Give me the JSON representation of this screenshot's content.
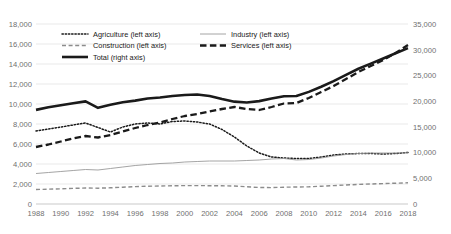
{
  "chart_data": {
    "type": "line",
    "title": "",
    "subtitle": "",
    "xlabel": "",
    "ylabel": "",
    "y2label": "",
    "ylim": [
      0,
      18000
    ],
    "y2lim": [
      0,
      35000
    ],
    "ytick_step": 2000,
    "y2tick_step": 5000,
    "grid": true,
    "legend_position": "top-left-inside",
    "x": [
      1988,
      1989,
      1990,
      1991,
      1992,
      1993,
      1994,
      1995,
      1996,
      1997,
      1998,
      1999,
      2000,
      2001,
      2002,
      2003,
      2004,
      2005,
      2006,
      2007,
      2008,
      2009,
      2010,
      2011,
      2012,
      2013,
      2014,
      2015,
      2016,
      2017,
      2018
    ],
    "xticks": [
      1988,
      1990,
      1992,
      1994,
      1996,
      1998,
      2000,
      2002,
      2004,
      2006,
      2008,
      2010,
      2012,
      2014,
      2016,
      2018
    ],
    "xtick_labels": [
      "1988",
      "1990",
      "1992",
      "1994",
      "1996",
      "1998",
      "2000",
      "2002",
      "2004",
      "2006",
      "2008",
      "2010",
      "2012",
      "2014",
      "2016",
      "2018"
    ],
    "ytick_labels": [
      "0",
      "2,000",
      "4,000",
      "6,000",
      "8,000",
      "10,000",
      "12,000",
      "14,000",
      "16,000",
      "18,000"
    ],
    "y2tick_labels": [
      "0",
      "5,000",
      "10,000",
      "15,000",
      "20,000",
      "25,000",
      "30,000",
      "35,000"
    ],
    "series": [
      {
        "name": "Agriculture (left axis)",
        "axis": "left",
        "style": "dotted",
        "color": "#1a1a1a",
        "width": 1.5,
        "values": [
          7300,
          7500,
          7700,
          7900,
          8100,
          7650,
          7200,
          7700,
          8000,
          8100,
          8000,
          8250,
          8300,
          8200,
          8000,
          7450,
          6700,
          5800,
          5100,
          4700,
          4600,
          4550,
          4550,
          4700,
          4900,
          5000,
          5050,
          5050,
          5000,
          5050,
          5150
        ]
      },
      {
        "name": "Industry (left axis)",
        "axis": "left",
        "style": "thin-solid",
        "color": "#9a9a9a",
        "width": 0.9,
        "values": [
          3050,
          3150,
          3250,
          3350,
          3450,
          3400,
          3550,
          3700,
          3850,
          3950,
          4050,
          4100,
          4200,
          4250,
          4300,
          4300,
          4300,
          4350,
          4400,
          4500,
          4550,
          4400,
          4450,
          4600,
          4800,
          4950,
          5050,
          5100,
          5100,
          5100,
          5120
        ]
      },
      {
        "name": "Construction (left axis)",
        "axis": "left",
        "style": "dashed",
        "color": "#8c8c8c",
        "width": 1.4,
        "values": [
          1450,
          1480,
          1520,
          1560,
          1600,
          1580,
          1620,
          1680,
          1740,
          1780,
          1800,
          1820,
          1840,
          1840,
          1830,
          1820,
          1800,
          1720,
          1650,
          1640,
          1680,
          1700,
          1720,
          1780,
          1840,
          1900,
          1960,
          2000,
          2040,
          2080,
          2120
        ]
      },
      {
        "name": "Services (left axis)",
        "axis": "left",
        "style": "thick-dashed",
        "color": "#1a1a1a",
        "width": 2.3,
        "values": [
          5700,
          5950,
          6250,
          6550,
          6800,
          6650,
          6900,
          7250,
          7600,
          7900,
          8150,
          8500,
          8800,
          9000,
          9250,
          9500,
          9700,
          9500,
          9400,
          9700,
          10050,
          10100,
          10600,
          11200,
          11800,
          12500,
          13200,
          13800,
          14400,
          15100,
          15900
        ]
      },
      {
        "name": "Total (right axis)",
        "axis": "right",
        "style": "thick-solid",
        "color": "#1a1a1a",
        "width": 2.6,
        "values": [
          18300,
          18800,
          19200,
          19600,
          19950,
          18700,
          19300,
          19800,
          20100,
          20500,
          20700,
          21000,
          21200,
          21300,
          21000,
          20400,
          19900,
          19750,
          20000,
          20500,
          20950,
          21000,
          21800,
          22800,
          23900,
          25100,
          26300,
          27300,
          28300,
          29300,
          30300
        ]
      }
    ]
  },
  "legend": {
    "entries": [
      {
        "label": "Agriculture (left axis)",
        "marker": "dotted-line-icon"
      },
      {
        "label": "Industry (left axis)",
        "marker": "thin-line-icon"
      },
      {
        "label": "Construction  (left axis)",
        "marker": "dashed-line-icon"
      },
      {
        "label": "Services (left axis)",
        "marker": "thick-dashed-line-icon"
      },
      {
        "label": "Total (right axis)",
        "marker": "thick-solid-line-icon"
      }
    ]
  }
}
